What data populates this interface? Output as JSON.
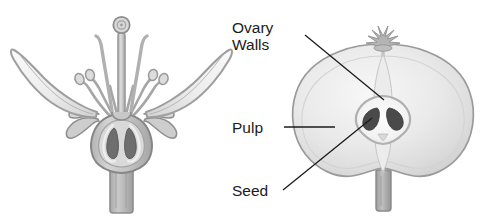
{
  "figure": {
    "background_color": "#ffffff",
    "panels": [
      {
        "id": "flower-diagram",
        "name": "flower-longitudinal-section",
        "side": "left",
        "caption": "",
        "parts": [
          "stigma",
          "style",
          "stamen-filament",
          "anther",
          "petal",
          "sepal",
          "ovary",
          "ovule",
          "pedicel"
        ]
      },
      {
        "id": "fruit-diagram",
        "name": "apple-cross-section",
        "side": "right",
        "caption": "",
        "parts": [
          "calyx",
          "ovary-walls",
          "pulp",
          "seed",
          "core-cavity",
          "stem"
        ]
      }
    ]
  },
  "labels": [
    {
      "id": "ovary-walls",
      "line1": "Ovary",
      "line2": "Walls",
      "text": "Ovary Walls",
      "leader": "diagonal-down-right"
    },
    {
      "id": "pulp",
      "line1": "Pulp",
      "line2": "",
      "text": "Pulp",
      "leader": "horizontal"
    },
    {
      "id": "seed",
      "line1": "Seed",
      "line2": "",
      "text": "Seed",
      "leader": "diagonal-up-right"
    }
  ],
  "colors": {
    "background": "#ffffff",
    "label_text": "#1b1b1b",
    "leader_line": "#1b1b1b",
    "outline_dark": "#8e8e8e",
    "outline_mid": "#a8a8a8",
    "fill_light": "#f0f0f0",
    "fill_mid": "#dcdcdc",
    "fill_gray": "#c4c4c4",
    "fill_deep": "#9a9a9a",
    "seed_dark": "#4a4a4a",
    "ovule_dark": "#6b6b6b"
  }
}
